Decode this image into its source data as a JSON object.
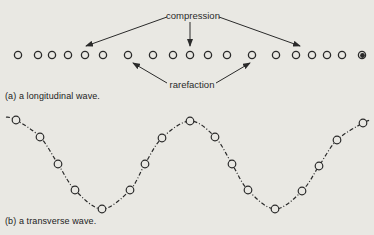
{
  "figure": {
    "background": "#e9e8e3",
    "ink_color": "#2a2a2a"
  },
  "panel_a": {
    "caption": "(a) a longitudinal wave.",
    "labels": {
      "compression": "compression",
      "rarefaction": "rarefaction"
    },
    "particles_y": 55,
    "particles_x": [
      18,
      38,
      52,
      68,
      85,
      103,
      128,
      153,
      173,
      190,
      208,
      227,
      252,
      276,
      296,
      312,
      327,
      342,
      362
    ],
    "last_particle_filled": true,
    "compression_arrow_targets": [
      [
        85,
        47
      ],
      [
        190,
        47
      ],
      [
        300,
        47
      ]
    ],
    "rarefaction_arrow_targets": [
      [
        132,
        63
      ],
      [
        250,
        63
      ]
    ]
  },
  "panel_b": {
    "caption": "(b) a transverse wave.",
    "particles": [
      [
        16,
        120
      ],
      [
        40,
        137
      ],
      [
        58,
        164
      ],
      [
        75,
        190
      ],
      [
        102,
        209
      ],
      [
        130,
        190
      ],
      [
        145,
        164
      ],
      [
        162,
        138
      ],
      [
        190,
        121
      ],
      [
        215,
        137
      ],
      [
        232,
        164
      ],
      [
        248,
        190
      ],
      [
        275,
        209
      ],
      [
        302,
        191
      ],
      [
        319,
        166
      ],
      [
        337,
        140
      ],
      [
        363,
        123
      ]
    ]
  }
}
